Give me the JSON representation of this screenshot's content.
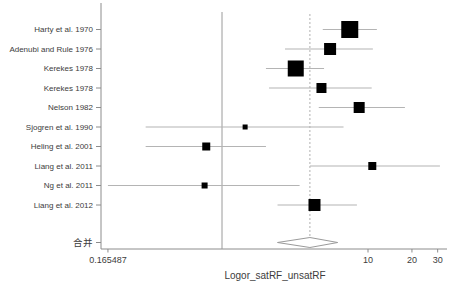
{
  "figure": {
    "xlabel": "Logor_satRF_unsatRF",
    "x_min_tick_label": "0.165487"
  },
  "chart_data": {
    "type": "forest",
    "title": "",
    "xlabel": "Logor_satRF_unsatRF",
    "x_scale": "log",
    "x_ticks": [
      0.165487,
      10,
      20,
      30
    ],
    "x_tick_labels": [
      "0.165487",
      "10",
      "20",
      "30"
    ],
    "null_line_value": 1,
    "pooled_line_value": 4.0,
    "studies": [
      {
        "label": "Harty et al. 1970",
        "estimate": 7.5,
        "ci_low": 4.9,
        "ci_high": 11.5,
        "box_px": 17
      },
      {
        "label": "Adenubi and Rule 1976",
        "estimate": 5.5,
        "ci_low": 2.7,
        "ci_high": 10.8,
        "box_px": 12
      },
      {
        "label": "Kerekes 1978",
        "estimate": 3.2,
        "ci_low": 2.0,
        "ci_high": 5.0,
        "box_px": 16
      },
      {
        "label": "Kerekes 1978",
        "estimate": 4.8,
        "ci_low": 2.1,
        "ci_high": 10.6,
        "box_px": 10
      },
      {
        "label": "Nelson 1982",
        "estimate": 8.7,
        "ci_low": 4.6,
        "ci_high": 17.9,
        "box_px": 11
      },
      {
        "label": "Sjogren et al. 1990",
        "estimate": 1.44,
        "ci_low": 0.3,
        "ci_high": 6.8,
        "box_px": 5
      },
      {
        "label": "Heling et al. 2001",
        "estimate": 0.78,
        "ci_low": 0.3,
        "ci_high": 2.0,
        "box_px": 8
      },
      {
        "label": "Liang et al. 2011",
        "estimate": 10.7,
        "ci_low": 4.0,
        "ci_high": 31.1,
        "box_px": 8
      },
      {
        "label": "Ng et al. 2011",
        "estimate": 0.76,
        "ci_low": 0.165487,
        "ci_high": 3.4,
        "box_px": 6
      },
      {
        "label": "Liang et al. 2012",
        "estimate": 4.3,
        "ci_low": 2.4,
        "ci_high": 8.4,
        "box_px": 12
      }
    ],
    "pooled": {
      "label": "合并",
      "estimate": 4.0,
      "ci_low": 2.4,
      "ci_high": 6.2
    }
  },
  "colors": {
    "background": "#ffffff",
    "axis": "#8c8c8c",
    "ci_line": "#b4b4b4",
    "null_line": "#9a9a9a",
    "pooled_dash_line": "#b0b0b0",
    "effect_square": "#000000",
    "diamond_stroke": "#9a9a9a",
    "diamond_fill": "#ffffff",
    "text": "#3c3c3c"
  }
}
